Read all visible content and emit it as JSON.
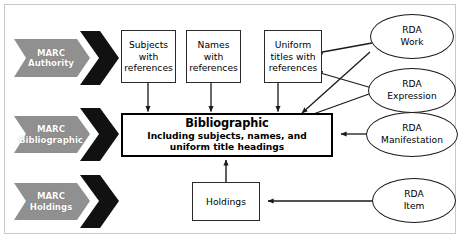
{
  "diagram": {
    "colors": {
      "banner_gray": "#909090",
      "banner_chevron": "#111111",
      "box_border": "#2a2a2a",
      "emphasis_border": "#000000",
      "frame_border": "#c9c9c9",
      "background": "#ffffff",
      "text": "#000000",
      "banner_text": "#ffffff"
    },
    "sources": [
      {
        "id": "marc-authority",
        "line1": "MARC",
        "line2": "Authority"
      },
      {
        "id": "marc-bibliographic",
        "line1": "MARC",
        "line2": "Bibliographic"
      },
      {
        "id": "marc-holdings",
        "line1": "MARC",
        "line2": "Holdings"
      }
    ],
    "reference_boxes": [
      {
        "id": "subjects-with-references",
        "line1": "Subjects",
        "line2": "with",
        "line3": "references"
      },
      {
        "id": "names-with-references",
        "line1": "Names",
        "line2": "with",
        "line3": "references"
      },
      {
        "id": "uniform-titles-with-references",
        "line1": "Uniform",
        "line2": "titles with",
        "line3": "references"
      }
    ],
    "bibliographic": {
      "id": "bibliographic-record",
      "title": "Bibliographic",
      "subtitle_line1": "Including subjects, names, and",
      "subtitle_line2": "uniform title headings"
    },
    "holdings": {
      "id": "holdings-record",
      "label": "Holdings"
    },
    "rda_entities": [
      {
        "id": "rda-work",
        "line1": "RDA",
        "line2": "Work"
      },
      {
        "id": "rda-expression",
        "line1": "RDA",
        "line2": "Expression"
      },
      {
        "id": "rda-manifestation",
        "line1": "RDA",
        "line2": "Manifestation"
      },
      {
        "id": "rda-item",
        "line1": "RDA",
        "line2": "Item"
      }
    ]
  }
}
